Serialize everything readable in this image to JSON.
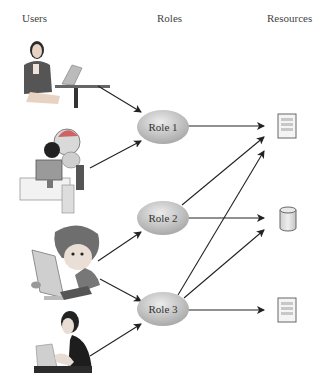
{
  "headers": {
    "users": "Users",
    "roles": "Roles",
    "resources": "Resources"
  },
  "users": [
    {
      "id": "user-1",
      "depiction": "woman in suit seated at table with laptop"
    },
    {
      "id": "user-2",
      "depiction": "cartoon dog character at desktop computer"
    },
    {
      "id": "user-3",
      "depiction": "cartoon boy typing at computer monitor"
    },
    {
      "id": "user-4",
      "depiction": "woman with dark hair leaning on laptop"
    }
  ],
  "roles": [
    {
      "label": "Role 1"
    },
    {
      "label": "Role 2"
    },
    {
      "label": "Role 3"
    }
  ],
  "resources": [
    {
      "type": "document-icon"
    },
    {
      "type": "database-icon"
    },
    {
      "type": "document-icon"
    }
  ],
  "edges": {
    "user_to_role": [
      [
        "user-1",
        "Role 1"
      ],
      [
        "user-2",
        "Role 1"
      ],
      [
        "user-3",
        "Role 2"
      ],
      [
        "user-3",
        "Role 3"
      ],
      [
        "user-4",
        "Role 3"
      ]
    ],
    "role_to_resource": [
      [
        "Role 1",
        "resource-1"
      ],
      [
        "Role 2",
        "resource-1"
      ],
      [
        "Role 2",
        "resource-2"
      ],
      [
        "Role 3",
        "resource-1"
      ],
      [
        "Role 3",
        "resource-2"
      ],
      [
        "Role 3",
        "resource-3"
      ]
    ]
  },
  "colors": {
    "ellipse_fill": "#bdbdbd",
    "ellipse_highlight": "#e6e6e6",
    "arrow": "#222222",
    "icon_stroke": "#666666"
  }
}
